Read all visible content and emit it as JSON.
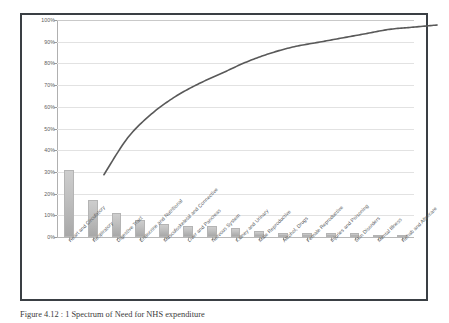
{
  "figure": {
    "caption": "Figure 4.12 : 1 Spectrum of Need for NHS expenditure",
    "frame_color": "#3a3f44",
    "background": "#ffffff"
  },
  "chart_data": {
    "type": "bar",
    "title": "",
    "xlabel": "",
    "ylabel": "",
    "ylim": [
      0,
      100
    ],
    "ytick_labels": [
      "0%",
      "10%",
      "20%",
      "30%",
      "40%",
      "50%",
      "60%",
      "70%",
      "80%",
      "90%",
      "100%"
    ],
    "ytick_values": [
      0,
      10,
      20,
      30,
      40,
      50,
      60,
      70,
      80,
      90,
      100
    ],
    "grid": true,
    "legend": "none",
    "categories": [
      "Heart and Circulatory",
      "Respiratory",
      "Digestive Tract",
      "Endocrine and Nutritional",
      "Musculoskeletal and Connective",
      "Liver and Pancreas",
      "Nervous System",
      "Kidney and Urinary",
      "Male Reproductive",
      "Alcohol, Drugs",
      "Female Reproductive",
      "Injuries and Poisoning",
      "Skin Disorders",
      "Mental Illness",
      "Rehab and Aftercare"
    ],
    "series": [
      {
        "name": "Share of expenditure",
        "chart_type": "bar",
        "values": [
          31,
          17,
          11,
          8,
          6,
          5,
          5,
          4,
          3,
          2,
          2,
          2,
          2,
          1,
          1
        ],
        "color": "#c0c0c0"
      },
      {
        "name": "Cumulative percentage",
        "chart_type": "line",
        "values": [
          31,
          48,
          59,
          67,
          73,
          78,
          83,
          87,
          90,
          92,
          94,
          96,
          98,
          99,
          100
        ],
        "color": "#595959"
      }
    ]
  }
}
